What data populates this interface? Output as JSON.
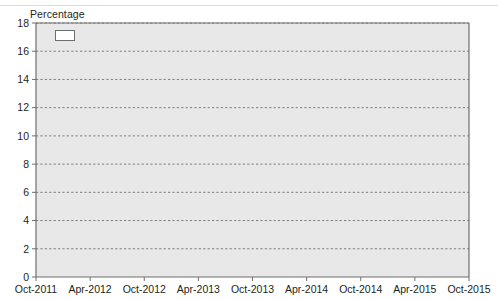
{
  "chart_data": {
    "type": "line",
    "title": "",
    "ylabel": "Percentage",
    "xlabel": "",
    "ylim": [
      0,
      18
    ],
    "ytick_step": 2,
    "yticks": [
      "0",
      "2",
      "4",
      "6",
      "8",
      "10",
      "12",
      "14",
      "16",
      "18"
    ],
    "grid": true,
    "grid_style": "dashed-horizontal",
    "legend_position": "top-left-inside",
    "step_style": "monthly-steps",
    "x": [
      "Oct-2011",
      "Apr-2012",
      "Oct-2012",
      "Apr-2013",
      "Oct-2013",
      "Apr-2014",
      "Oct-2014",
      "Apr-2015",
      "Oct-2015"
    ],
    "x_range_months": [
      "2011-10",
      "2015-10"
    ],
    "series": [
      {
        "name": "Brazil",
        "color": "#3b3b3b",
        "points": [
          {
            "x": "2011-10",
            "y": 12.0
          },
          {
            "x": "2011-12",
            "y": 11.6
          },
          {
            "x": "2012-02",
            "y": 11.3
          },
          {
            "x": "2012-04",
            "y": 11.0
          },
          {
            "x": "2012-06",
            "y": 10.6
          },
          {
            "x": "2012-08",
            "y": 10.2
          },
          {
            "x": "2012-10",
            "y": 9.5
          },
          {
            "x": "2012-12",
            "y": 9.0
          },
          {
            "x": "2013-02",
            "y": 8.5
          },
          {
            "x": "2013-04",
            "y": 8.0
          },
          {
            "x": "2013-06",
            "y": 7.6
          },
          {
            "x": "2013-08",
            "y": 7.4
          },
          {
            "x": "2013-10",
            "y": 7.3
          },
          {
            "x": "2013-12",
            "y": 7.3
          },
          {
            "x": "2014-02",
            "y": 7.6
          },
          {
            "x": "2014-04",
            "y": 8.0
          },
          {
            "x": "2014-06",
            "y": 8.4
          },
          {
            "x": "2014-08",
            "y": 8.8
          },
          {
            "x": "2014-10",
            "y": 9.2
          },
          {
            "x": "2014-12",
            "y": 9.6
          },
          {
            "x": "2015-02",
            "y": 10.1
          },
          {
            "x": "2015-03",
            "y": 10.6
          },
          {
            "x": "2015-04",
            "y": 11.1
          },
          {
            "x": "2015-05",
            "y": 11.6
          },
          {
            "x": "2015-06",
            "y": 12.1
          },
          {
            "x": "2015-07",
            "y": 12.7
          },
          {
            "x": "2015-08",
            "y": 13.3
          },
          {
            "x": "2015-09",
            "y": 13.8
          },
          {
            "x": "2015-10",
            "y": 14.25
          }
        ]
      },
      {
        "name": "China",
        "color": "#6e6e6e",
        "points": [
          {
            "x": "2011-10",
            "y": 5.4
          },
          {
            "x": "2012-06",
            "y": 5.4
          },
          {
            "x": "2012-12",
            "y": 5.3
          },
          {
            "x": "2013-06",
            "y": 5.2
          },
          {
            "x": "2013-12",
            "y": 5.1
          },
          {
            "x": "2014-04",
            "y": 5.0
          },
          {
            "x": "2014-08",
            "y": 5.0
          },
          {
            "x": "2014-11",
            "y": 4.9
          },
          {
            "x": "2015-01",
            "y": 4.7
          },
          {
            "x": "2015-04",
            "y": 4.5
          },
          {
            "x": "2015-07",
            "y": 4.3
          },
          {
            "x": "2015-09",
            "y": 4.4
          },
          {
            "x": "2015-10",
            "y": 4.35
          }
        ]
      },
      {
        "name": "India",
        "color": "#4f4f4f",
        "points": [
          {
            "x": "2011-10",
            "y": 8.2
          },
          {
            "x": "2012-02",
            "y": 8.4
          },
          {
            "x": "2012-06",
            "y": 8.4
          },
          {
            "x": "2013-02",
            "y": 8.4
          },
          {
            "x": "2013-08",
            "y": 8.4
          },
          {
            "x": "2014-02",
            "y": 8.4
          },
          {
            "x": "2014-06",
            "y": 8.3
          },
          {
            "x": "2014-10",
            "y": 8.2
          },
          {
            "x": "2015-01",
            "y": 8.0
          },
          {
            "x": "2015-04",
            "y": 7.8
          },
          {
            "x": "2015-07",
            "y": 7.5
          },
          {
            "x": "2015-09",
            "y": 7.3
          },
          {
            "x": "2015-10",
            "y": 7.25
          }
        ]
      },
      {
        "name": "Russian Federation",
        "color": "#8d8d8d",
        "points": [
          {
            "x": "2011-10",
            "y": 6.6
          },
          {
            "x": "2012-04",
            "y": 6.5
          },
          {
            "x": "2012-08",
            "y": 6.2
          },
          {
            "x": "2012-12",
            "y": 5.8
          },
          {
            "x": "2013-03",
            "y": 5.5
          },
          {
            "x": "2013-09",
            "y": 5.5
          },
          {
            "x": "2014-02",
            "y": 5.5
          },
          {
            "x": "2014-04",
            "y": 5.5
          },
          {
            "x": "2014-05",
            "y": 7.0
          },
          {
            "x": "2014-10",
            "y": 7.0
          },
          {
            "x": "2014-11",
            "y": 8.25
          },
          {
            "x": "2014-12",
            "y": 17.0
          },
          {
            "x": "2015-01",
            "y": 17.0
          },
          {
            "x": "2015-02",
            "y": 15.0
          },
          {
            "x": "2015-03",
            "y": 14.0
          },
          {
            "x": "2015-05",
            "y": 12.5
          },
          {
            "x": "2015-06",
            "y": 11.5
          },
          {
            "x": "2015-08",
            "y": 11.25
          },
          {
            "x": "2015-10",
            "y": 11.25
          }
        ]
      },
      {
        "name": "South Africa",
        "color": "#5c5c5c",
        "points": [
          {
            "x": "2011-10",
            "y": 5.5
          },
          {
            "x": "2012-06",
            "y": 5.5
          },
          {
            "x": "2013-02",
            "y": 5.5
          },
          {
            "x": "2013-09",
            "y": 5.5
          },
          {
            "x": "2014-01",
            "y": 5.0
          },
          {
            "x": "2014-04",
            "y": 5.0
          },
          {
            "x": "2014-07",
            "y": 5.75
          },
          {
            "x": "2014-12",
            "y": 5.75
          },
          {
            "x": "2015-03",
            "y": 5.75
          },
          {
            "x": "2015-07",
            "y": 6.0
          },
          {
            "x": "2015-10",
            "y": 6.0
          }
        ]
      }
    ],
    "legend": [
      {
        "label": "Brazil",
        "color": "#3b3b3b"
      },
      {
        "label": "China",
        "color": "#6e6e6e"
      },
      {
        "label": "India",
        "color": "#4f4f4f"
      },
      {
        "label": "Russian Federation",
        "color": "#8d8d8d"
      },
      {
        "label": "South Africa",
        "color": "#5c5c5c"
      }
    ],
    "plot_background": "#e8e8e8",
    "grid_color": "#6f6f6f",
    "axis_color": "#6f6f6f"
  }
}
